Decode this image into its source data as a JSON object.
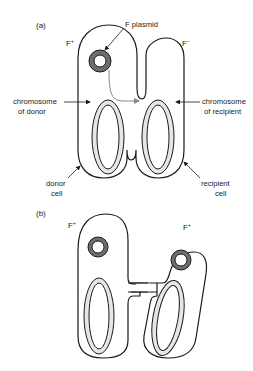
{
  "diagram": {
    "panel_a": {
      "label": "(a)",
      "donor_state": "F",
      "donor_sup": "+",
      "recipient_state": "F",
      "recipient_sup": "−",
      "plasmid_label": "F plasmid",
      "chromosome_donor": [
        "chromosome",
        "of donor"
      ],
      "chromosome_recipient": [
        "chromosome",
        "of recipient"
      ],
      "donor_cell": [
        "donor",
        "cell"
      ],
      "recipient_cell": [
        "recipient",
        "cell"
      ]
    },
    "panel_b": {
      "label": "(b)",
      "left_state": "F",
      "left_sup": "+",
      "right_state": "F",
      "right_sup": "+"
    },
    "colors": {
      "outline": "#1a1a1a",
      "chromosome_fill": "#e6e6e6",
      "plasmid_fill": "#6e6e6e",
      "transfer_arrow": "#888888"
    }
  }
}
